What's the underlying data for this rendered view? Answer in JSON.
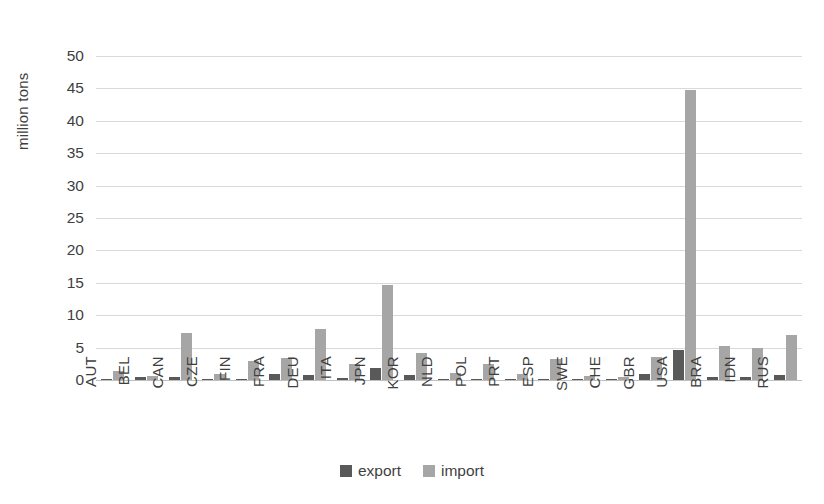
{
  "chart_data": {
    "type": "bar",
    "title": "",
    "xlabel": "",
    "ylabel": "million tons",
    "ylim": [
      0,
      50
    ],
    "ytick_step": 5,
    "yticks": [
      50,
      45,
      40,
      35,
      30,
      25,
      20,
      15,
      10,
      5,
      0
    ],
    "grid": true,
    "legend_position": "bottom",
    "categories": [
      "AUT",
      "BEL",
      "CAN",
      "CZE",
      "FIN",
      "FRA",
      "DEU",
      "ITA",
      "JPN",
      "KOR",
      "NLD",
      "POL",
      "PRT",
      "ESP",
      "SWE",
      "CHE",
      "GBR",
      "USA",
      "BRA",
      "IDN",
      "RUS"
    ],
    "series": [
      {
        "name": "export",
        "color": "#595959",
        "values": [
          0.15,
          0.45,
          0.5,
          0.1,
          0.15,
          0.9,
          0.8,
          0.3,
          1.8,
          0.7,
          0.1,
          0.1,
          0.1,
          0.15,
          0.15,
          0.1,
          0.9,
          4.7,
          0.5,
          0.4,
          0.8
        ]
      },
      {
        "name": "import",
        "color": "#a6a6a6",
        "values": [
          1.4,
          0.6,
          7.2,
          0.9,
          3.0,
          3.4,
          7.8,
          2.4,
          14.7,
          4.1,
          1.1,
          2.5,
          0.9,
          3.2,
          0.6,
          0.5,
          3.5,
          44.7,
          5.3,
          4.9,
          6.9
        ]
      }
    ]
  },
  "legend": {
    "items": [
      {
        "label": "export",
        "swatch": "export-swatch"
      },
      {
        "label": "import",
        "swatch": "import-swatch"
      }
    ]
  }
}
